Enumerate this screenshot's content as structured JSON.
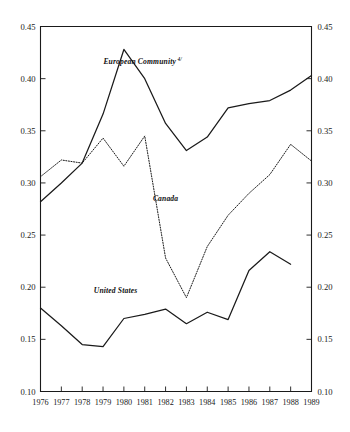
{
  "chart_data": {
    "type": "line",
    "title": "",
    "subtitle": "",
    "xlabel": "",
    "ylabel": "",
    "x": [
      1976,
      1977,
      1978,
      1979,
      1980,
      1981,
      1982,
      1983,
      1984,
      1985,
      1986,
      1987,
      1988,
      1989
    ],
    "categories": [
      "1976",
      "1977",
      "1978",
      "1979",
      "1980",
      "1981",
      "1982",
      "1983",
      "1984",
      "1985",
      "1986",
      "1987",
      "1988",
      "1989"
    ],
    "xlim": [
      1976,
      1989
    ],
    "ylim": [
      0.1,
      0.45
    ],
    "y_ticks": [
      0.1,
      0.15,
      0.2,
      0.25,
      0.3,
      0.35,
      0.4,
      0.45
    ],
    "y_tick_labels": [
      "0.10",
      "0.15",
      "0.20",
      "0.25",
      "0.30",
      "0.35",
      "0.40",
      "0.45"
    ],
    "grid": false,
    "legend": "inline-annotations",
    "dual_y_axis": true,
    "series": [
      {
        "name": "European Community",
        "footnote_marker": "4/",
        "label": "European Community",
        "style": "solid",
        "color": "#1a1a1a",
        "x": [
          1976,
          1977,
          1978,
          1979,
          1980,
          1981,
          1982,
          1983,
          1984,
          1985,
          1986,
          1987,
          1988,
          1989
        ],
        "values": [
          0.282,
          0.3,
          0.319,
          0.366,
          0.428,
          0.4,
          0.357,
          0.331,
          0.344,
          0.372,
          0.376,
          0.379,
          0.389,
          0.403
        ],
        "label_x": 1980.9,
        "label_y": 0.414
      },
      {
        "name": "Canada",
        "label": "Canada",
        "style": "dotted",
        "color": "#1a1a1a",
        "x": [
          1976,
          1977,
          1978,
          1979,
          1980,
          1981,
          1982,
          1983,
          1984,
          1985,
          1986,
          1987,
          1988,
          1989
        ],
        "values": [
          0.306,
          0.322,
          0.319,
          0.343,
          0.316,
          0.345,
          0.228,
          0.19,
          0.239,
          0.269,
          0.29,
          0.308,
          0.337,
          0.321
        ],
        "label_x": 1982.0,
        "label_y": 0.283
      },
      {
        "name": "United States",
        "label": "United States",
        "style": "solid",
        "color": "#1a1a1a",
        "x": [
          1976,
          1977,
          1978,
          1979,
          1980,
          1981,
          1982,
          1983,
          1984,
          1985,
          1986,
          1987,
          1988
        ],
        "values": [
          0.18,
          0.163,
          0.145,
          0.143,
          0.17,
          0.174,
          0.179,
          0.165,
          0.176,
          0.169,
          0.216,
          0.234,
          0.222
        ],
        "label_x": 1979.6,
        "label_y": 0.194
      }
    ]
  },
  "axes": {
    "left": {
      "name": "left-y-axis",
      "ticks": [
        "0.45",
        "0.40",
        "0.35",
        "0.30",
        "0.25",
        "0.20",
        "0.15",
        "0.10"
      ]
    },
    "right": {
      "name": "right-y-axis",
      "ticks": [
        "0.45",
        "0.40",
        "0.35",
        "0.30",
        "0.25",
        "0.20",
        "0.15",
        "0.10"
      ]
    },
    "bottom": {
      "name": "x-axis",
      "ticks": [
        "1976",
        "1977",
        "1978",
        "1979",
        "1980",
        "1981",
        "1982",
        "1983",
        "1984",
        "1985",
        "1986",
        "1987",
        "1988",
        "1989"
      ]
    }
  }
}
